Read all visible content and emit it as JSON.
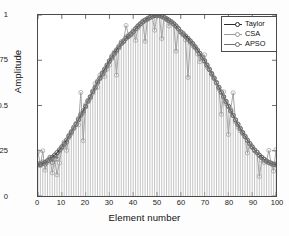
{
  "chart_data": {
    "type": "line",
    "title": "",
    "xlabel": "Element number",
    "ylabel": "Amplitude",
    "xlim": [
      0,
      100
    ],
    "ylim": [
      0,
      1
    ],
    "xticks": [
      0,
      10,
      20,
      30,
      40,
      50,
      60,
      70,
      80,
      90,
      100
    ],
    "yticks": [
      0,
      0.25,
      0.5,
      0.75,
      1
    ],
    "xtick_labels": [
      "0",
      "10",
      "20",
      "30",
      "40",
      "50",
      "60",
      "70",
      "80",
      "90",
      "100"
    ],
    "ytick_labels": [
      "0",
      "0.25",
      "0.5",
      "0.75",
      "1"
    ],
    "grid": false,
    "legend_position": "top-right",
    "legend": [
      "Taylor",
      "CSA",
      "APSO"
    ],
    "stems": true,
    "marker": "circle",
    "series": [
      {
        "name": "Taylor",
        "color": "#2b2b2b",
        "linewidth": 1.1,
        "x": [
          0,
          1,
          2,
          3,
          4,
          5,
          6,
          7,
          8,
          9,
          10,
          11,
          12,
          13,
          14,
          15,
          16,
          17,
          18,
          19,
          20,
          21,
          22,
          23,
          24,
          25,
          26,
          27,
          28,
          29,
          30,
          31,
          32,
          33,
          34,
          35,
          36,
          37,
          38,
          39,
          40,
          41,
          42,
          43,
          44,
          45,
          46,
          47,
          48,
          49,
          50,
          51,
          52,
          53,
          54,
          55,
          56,
          57,
          58,
          59,
          60,
          61,
          62,
          63,
          64,
          65,
          66,
          67,
          68,
          69,
          70,
          71,
          72,
          73,
          74,
          75,
          76,
          77,
          78,
          79,
          80,
          81,
          82,
          83,
          84,
          85,
          86,
          87,
          88,
          89,
          90,
          91,
          92,
          93,
          94,
          95,
          96,
          97,
          98,
          99,
          100
        ],
        "values": [
          0.172,
          0.175,
          0.18,
          0.186,
          0.194,
          0.203,
          0.214,
          0.226,
          0.24,
          0.255,
          0.272,
          0.29,
          0.309,
          0.33,
          0.351,
          0.374,
          0.397,
          0.421,
          0.446,
          0.471,
          0.497,
          0.523,
          0.549,
          0.575,
          0.601,
          0.627,
          0.652,
          0.677,
          0.701,
          0.724,
          0.747,
          0.768,
          0.788,
          0.807,
          0.825,
          0.842,
          0.857,
          0.871,
          0.884,
          0.896,
          0.906,
          0.925,
          0.94,
          0.952,
          0.963,
          0.972,
          0.98,
          0.987,
          0.993,
          0.997,
          1.0,
          0.997,
          0.993,
          0.987,
          0.98,
          0.972,
          0.963,
          0.952,
          0.94,
          0.925,
          0.906,
          0.896,
          0.884,
          0.871,
          0.857,
          0.842,
          0.825,
          0.807,
          0.788,
          0.768,
          0.747,
          0.724,
          0.701,
          0.677,
          0.652,
          0.627,
          0.601,
          0.575,
          0.549,
          0.523,
          0.497,
          0.471,
          0.446,
          0.421,
          0.397,
          0.374,
          0.351,
          0.33,
          0.309,
          0.29,
          0.272,
          0.255,
          0.24,
          0.226,
          0.214,
          0.203,
          0.194,
          0.186,
          0.18,
          0.175,
          0.172
        ]
      },
      {
        "name": "CSA",
        "color": "#9a9a9a",
        "linewidth": 0.9,
        "x": [
          0,
          1,
          2,
          3,
          4,
          5,
          6,
          7,
          8,
          9,
          10,
          11,
          12,
          13,
          14,
          15,
          16,
          17,
          18,
          19,
          20,
          21,
          22,
          23,
          24,
          25,
          26,
          27,
          28,
          29,
          30,
          31,
          32,
          33,
          34,
          35,
          36,
          37,
          38,
          39,
          40,
          41,
          42,
          43,
          44,
          45,
          46,
          47,
          48,
          49,
          50,
          51,
          52,
          53,
          54,
          55,
          56,
          57,
          58,
          59,
          60,
          61,
          62,
          63,
          64,
          65,
          66,
          67,
          68,
          69,
          70,
          71,
          72,
          73,
          74,
          75,
          76,
          77,
          78,
          79,
          80,
          81,
          82,
          83,
          84,
          85,
          86,
          87,
          88,
          89,
          90,
          91,
          92,
          93,
          94,
          95,
          96,
          97,
          98,
          99,
          100
        ],
        "values": [
          0.245,
          0.168,
          0.25,
          0.143,
          0.186,
          0.21,
          0.128,
          0.2,
          0.117,
          0.182,
          0.262,
          0.3,
          0.252,
          0.322,
          0.345,
          0.372,
          0.402,
          0.393,
          0.572,
          0.306,
          0.505,
          0.521,
          0.54,
          0.568,
          0.62,
          0.601,
          0.668,
          0.682,
          0.66,
          0.7,
          0.723,
          0.775,
          0.795,
          0.668,
          0.828,
          0.853,
          0.86,
          0.942,
          0.89,
          0.888,
          0.914,
          0.86,
          0.928,
          0.952,
          0.967,
          0.855,
          0.978,
          0.99,
          0.995,
          0.916,
          1.0,
          0.997,
          0.87,
          0.988,
          0.975,
          0.94,
          0.963,
          0.948,
          0.8,
          0.925,
          0.905,
          0.9,
          0.862,
          0.655,
          0.845,
          0.83,
          0.818,
          0.785,
          0.742,
          0.768,
          0.78,
          0.713,
          0.7,
          0.674,
          0.648,
          0.627,
          0.59,
          0.452,
          0.575,
          0.51,
          0.34,
          0.48,
          0.57,
          0.409,
          0.38,
          0.36,
          0.344,
          0.325,
          0.238,
          0.29,
          0.268,
          0.25,
          0.242,
          0.108,
          0.196,
          0.185,
          0.19,
          0.252,
          0.176,
          0.138,
          0.256
        ]
      },
      {
        "name": "APSO",
        "color": "#6e6e6e",
        "linewidth": 0.9,
        "x": [
          0,
          1,
          2,
          3,
          4,
          5,
          6,
          7,
          8,
          9,
          10,
          11,
          12,
          13,
          14,
          15,
          16,
          17,
          18,
          19,
          20,
          21,
          22,
          23,
          24,
          25,
          26,
          27,
          28,
          29,
          30,
          31,
          32,
          33,
          34,
          35,
          36,
          37,
          38,
          39,
          40,
          41,
          42,
          43,
          44,
          45,
          46,
          47,
          48,
          49,
          50,
          51,
          52,
          53,
          54,
          55,
          56,
          57,
          58,
          59,
          60,
          61,
          62,
          63,
          64,
          65,
          66,
          67,
          68,
          69,
          70,
          71,
          72,
          73,
          74,
          75,
          76,
          77,
          78,
          79,
          80,
          81,
          82,
          83,
          84,
          85,
          86,
          87,
          88,
          89,
          90,
          91,
          92,
          93,
          94,
          95,
          96,
          97,
          98,
          99,
          100
        ],
        "values": [
          0.18,
          0.172,
          0.188,
          0.176,
          0.196,
          0.214,
          0.186,
          0.225,
          0.205,
          0.248,
          0.268,
          0.284,
          0.298,
          0.335,
          0.356,
          0.38,
          0.396,
          0.428,
          0.452,
          0.462,
          0.492,
          0.528,
          0.545,
          0.58,
          0.596,
          0.635,
          0.648,
          0.67,
          0.694,
          0.718,
          0.742,
          0.76,
          0.782,
          0.8,
          0.818,
          0.846,
          0.852,
          0.878,
          0.88,
          0.893,
          0.908,
          0.922,
          0.936,
          0.948,
          0.96,
          0.97,
          0.976,
          0.985,
          0.992,
          0.996,
          0.999,
          0.996,
          0.991,
          0.985,
          0.976,
          0.968,
          0.961,
          0.95,
          0.936,
          0.922,
          0.908,
          0.89,
          0.88,
          0.866,
          0.852,
          0.84,
          0.822,
          0.802,
          0.786,
          0.764,
          0.744,
          0.722,
          0.698,
          0.672,
          0.65,
          0.624,
          0.598,
          0.572,
          0.546,
          0.52,
          0.494,
          0.468,
          0.444,
          0.418,
          0.394,
          0.37,
          0.348,
          0.328,
          0.306,
          0.288,
          0.27,
          0.252,
          0.242,
          0.224,
          0.212,
          0.202,
          0.192,
          0.184,
          0.182,
          0.174,
          0.178
        ]
      }
    ]
  },
  "axes": {
    "ylabel": "Amplitude",
    "xlabel": "Element number",
    "ytick_labels": [
      "1",
      "0.75",
      "0.5",
      "0.25",
      "0"
    ],
    "xtick_labels": [
      "0",
      "10",
      "20",
      "30",
      "40",
      "50",
      "60",
      "70",
      "80",
      "90",
      "100"
    ]
  },
  "legend": {
    "items": [
      {
        "label": "Taylor",
        "color": "#2b2b2b"
      },
      {
        "label": "CSA",
        "color": "#9a9a9a"
      },
      {
        "label": "APSO",
        "color": "#6e6e6e"
      }
    ]
  }
}
